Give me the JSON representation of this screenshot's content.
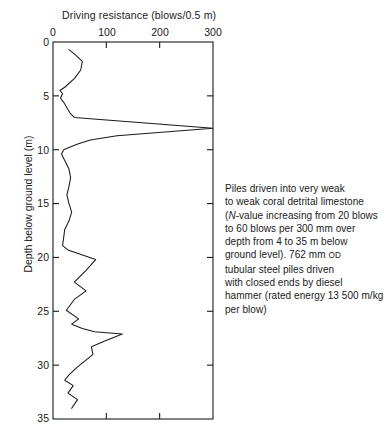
{
  "chart_data": {
    "type": "line",
    "title": "Driving resistance (blows/0.5 m)",
    "xlabel": "Driving resistance (blows/0.5 m)",
    "ylabel": "Depth below ground level (m)",
    "xlim": [
      0,
      300
    ],
    "ylim": [
      0,
      35
    ],
    "y_inverted": true,
    "grid": false,
    "legend": null,
    "xticks": [
      0,
      100,
      200,
      300
    ],
    "xticklabels": [
      "0",
      "100",
      "200",
      "300"
    ],
    "yticks": [
      0,
      5,
      10,
      15,
      20,
      25,
      30,
      35
    ],
    "yticklabels": [
      "0",
      "5",
      "10",
      "15",
      "20",
      "25",
      "30",
      "35"
    ],
    "series": [
      {
        "name": "Driving resistance profile",
        "color": "#1a1a1a",
        "x": [
          30,
          42,
          55,
          52,
          40,
          22,
          13,
          18,
          14,
          20,
          26,
          32,
          40,
          300,
          120,
          70,
          45,
          30,
          20,
          16,
          22,
          30,
          33,
          30,
          26,
          30,
          35,
          30,
          22,
          18,
          28,
          80,
          62,
          40,
          62,
          40,
          25,
          48,
          35,
          55,
          78,
          130,
          95,
          72,
          75,
          60,
          45,
          30,
          22,
          38,
          28,
          46,
          35
        ],
        "y": [
          0.7,
          1.2,
          1.8,
          2.6,
          3.4,
          4.2,
          4.5,
          4.8,
          5.2,
          5.6,
          6.1,
          6.6,
          7.0,
          8.0,
          8.7,
          9.1,
          9.5,
          9.8,
          10.0,
          10.4,
          11.0,
          11.8,
          12.6,
          13.4,
          14.2,
          15.0,
          15.8,
          16.6,
          17.4,
          18.9,
          19.3,
          20.2,
          21.2,
          22.3,
          23.1,
          23.9,
          24.9,
          25.7,
          26.2,
          26.6,
          26.9,
          27.1,
          27.8,
          28.3,
          29.0,
          29.6,
          30.2,
          30.9,
          31.4,
          31.9,
          32.6,
          33.2,
          34.0
        ]
      }
    ],
    "annotation": {
      "lines": [
        "Piles driven into very weak",
        "to weak coral detrital limestone",
        "(N-value increasing from 20 blows",
        "to 60 blows per 300 mm over",
        "depth from 4 to 35 m below",
        "ground level). 762 mm OD",
        "tubular steel piles driven",
        "with closed ends by diesel",
        "hammer (rated energy 13 500 m/kg",
        "per blow)"
      ]
    }
  }
}
